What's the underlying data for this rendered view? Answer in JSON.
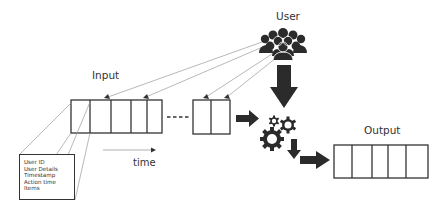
{
  "diagram": {
    "type": "data-flow",
    "labels": {
      "input": "Input",
      "user": "User",
      "output": "Output",
      "time": "time"
    },
    "record_fields": [
      "User ID",
      "User Details",
      "Timestamp",
      "Action time",
      "Items"
    ],
    "nodes": [
      {
        "id": "input-queue",
        "label": "Input",
        "shape": "segmented-box",
        "segments": 5
      },
      {
        "id": "input-queue-tail",
        "shape": "segmented-box",
        "segments": 2
      },
      {
        "id": "user-group",
        "label": "User",
        "shape": "people-icon"
      },
      {
        "id": "processor",
        "shape": "gears-icon"
      },
      {
        "id": "output-queue",
        "label": "Output",
        "shape": "segmented-box",
        "segments": 5
      },
      {
        "id": "record-detail",
        "shape": "box",
        "fields": [
          "User ID",
          "User Details",
          "Timestamp",
          "Action time",
          "Items"
        ]
      }
    ],
    "edges": [
      {
        "from": "user-group",
        "to": "input-queue",
        "style": "thin-arrow",
        "count": 2
      },
      {
        "from": "user-group",
        "to": "input-queue-tail",
        "style": "thin-arrow",
        "count": 2
      },
      {
        "from": "user-group",
        "to": "processor",
        "style": "thick-arrow"
      },
      {
        "from": "input-queue-tail",
        "to": "processor",
        "style": "thick-arrow"
      },
      {
        "from": "processor",
        "to": "output-queue",
        "style": "thick-arrow"
      }
    ],
    "colors": {
      "stroke": "#333333",
      "fill_dark": "#2b2b2b",
      "thin_line": "#9a9a9a",
      "background": "#ffffff"
    }
  }
}
